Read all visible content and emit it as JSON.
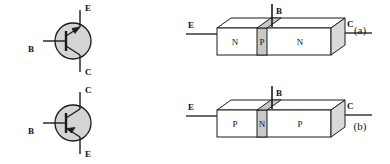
{
  "figure": {
    "title": "",
    "rows": [
      {
        "id": "row-a",
        "caption": "(a)",
        "symbol": {
          "type": "npn-transistor-symbol",
          "top_terminal": "E",
          "bottom_terminal": "C",
          "left_terminal": "B"
        },
        "block": {
          "type": "npn-block-diagram",
          "left_terminal": "E",
          "right_terminal": "C",
          "top_terminal": "B",
          "regions": [
            "N",
            "P",
            "N"
          ]
        }
      },
      {
        "id": "row-b",
        "caption": "(b)",
        "symbol": {
          "type": "pnp-transistor-symbol",
          "top_terminal": "C",
          "bottom_terminal": "E",
          "left_terminal": "B"
        },
        "block": {
          "type": "pnp-block-diagram",
          "left_terminal": "E",
          "right_terminal": "C",
          "top_terminal": "B",
          "regions": [
            "P",
            "N",
            "P"
          ]
        }
      }
    ]
  },
  "colors": {
    "ink": "#111111",
    "line": "#1a1a1a",
    "body_fill": "#ffffff",
    "base_fill": "#c8c8c8",
    "face_fill": "#d9d9d9",
    "symbol_fill": "#d4d4d4"
  }
}
